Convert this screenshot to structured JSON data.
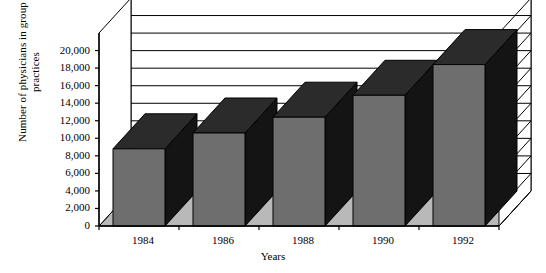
{
  "chart_data": {
    "type": "bar",
    "title": "",
    "subtitle": "",
    "xlabel": "Years",
    "ylabel": "Number of physicians in group practices",
    "ylabel_line1": "Number of physicians in group",
    "ylabel_line2": "practices",
    "categories": [
      "1984",
      "1986",
      "1988",
      "1990",
      "1992"
    ],
    "values": [
      8800,
      10600,
      12400,
      14900,
      18400
    ],
    "series": [
      {
        "name": "Number of physicians in group practices",
        "values": [
          8800,
          10600,
          12400,
          14900,
          18400
        ]
      }
    ],
    "ylim": [
      0,
      22000
    ],
    "ytick_values": [
      0,
      2000,
      4000,
      6000,
      8000,
      10000,
      12000,
      14000,
      16000,
      18000,
      20000
    ],
    "ytick_labels": [
      "0",
      "2,000",
      "4,000",
      "6,000",
      "8,000",
      "10,000",
      "12,000",
      "14,000",
      "16,000",
      "18,000",
      "20,000"
    ],
    "grid": true,
    "grid_axis": "y",
    "legend": false,
    "legend_position": "none",
    "three_d": true,
    "colors": {
      "bar_front": "#6e6e6e",
      "bar_top": "#2b2b2b",
      "bar_side": "#141414",
      "floor": "#b9b9b9",
      "wall": "#ffffff",
      "outline": "#000000",
      "text": "#000000"
    }
  }
}
